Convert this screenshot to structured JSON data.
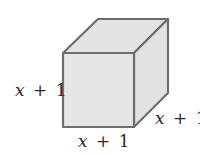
{
  "diagram": {
    "shape": "cube",
    "colors": {
      "face_fill": "#e6e6e6",
      "edge_stroke": "#6e6e6e",
      "label_color": "#2a2a2a"
    },
    "labels": {
      "height": {
        "variable": "x",
        "operator": "+",
        "constant": "1"
      },
      "width": {
        "variable": "x",
        "operator": "+",
        "constant": "1"
      },
      "depth": {
        "variable": "x",
        "operator": "+",
        "constant": "1"
      }
    }
  }
}
